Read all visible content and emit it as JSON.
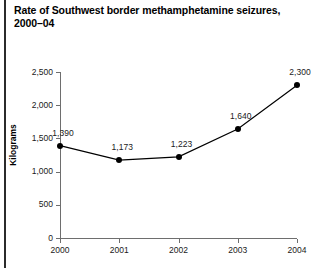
{
  "chart_data": {
    "type": "line",
    "title": "Rate of Southwest border methamphetamine seizures, 2000–04",
    "xlabel": "",
    "ylabel": "Kilograms",
    "categories": [
      "2000",
      "2001",
      "2002",
      "2003",
      "2004"
    ],
    "values": [
      1390,
      1173,
      1223,
      1640,
      2300
    ],
    "value_labels": [
      "1,390",
      "1,173",
      "1,223",
      "1,640",
      "2,300"
    ],
    "series": [
      {
        "name": "Kilograms",
        "values": [
          1390,
          1173,
          1223,
          1640,
          2300
        ]
      }
    ],
    "ylim": [
      0,
      2500
    ],
    "yticks": [
      0,
      500,
      1000,
      1500,
      2000,
      2500
    ],
    "ytick_labels": [
      "0",
      "500",
      "1,000",
      "1,500",
      "2,000",
      "2,500"
    ],
    "grid": false,
    "legend": false,
    "marker": "filled-circle",
    "line_color": "#000000",
    "marker_color": "#000000",
    "axis_color": "#6e6e6e",
    "background": "#ffffff"
  }
}
